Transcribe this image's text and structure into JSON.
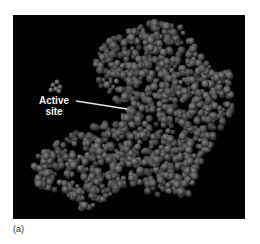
{
  "figure": {
    "label_line1": "Active",
    "label_line2": "site",
    "caption": "(a)",
    "background_color": "#020202",
    "sphere_color_light": "#7a7a7a",
    "sphere_color_dark": "#2c2c2c",
    "pointer_color": "#e8e8e8"
  },
  "protein_outline": [
    [
      95,
      25
    ],
    [
      135,
      5
    ],
    [
      170,
      12
    ],
    [
      190,
      45
    ],
    [
      218,
      58
    ],
    [
      222,
      95
    ],
    [
      205,
      120
    ],
    [
      190,
      145
    ],
    [
      178,
      180
    ],
    [
      150,
      182
    ],
    [
      115,
      170
    ],
    [
      95,
      185
    ],
    [
      70,
      195
    ],
    [
      52,
      180
    ],
    [
      22,
      170
    ],
    [
      20,
      145
    ],
    [
      45,
      125
    ],
    [
      90,
      108
    ],
    [
      110,
      100
    ],
    [
      112,
      92
    ],
    [
      88,
      75
    ],
    [
      80,
      45
    ]
  ],
  "ligand_spheres": [
    [
      40,
      70
    ],
    [
      44,
      67
    ],
    [
      47,
      72
    ],
    [
      43,
      74
    ],
    [
      38,
      75
    ],
    [
      46,
      76
    ]
  ]
}
